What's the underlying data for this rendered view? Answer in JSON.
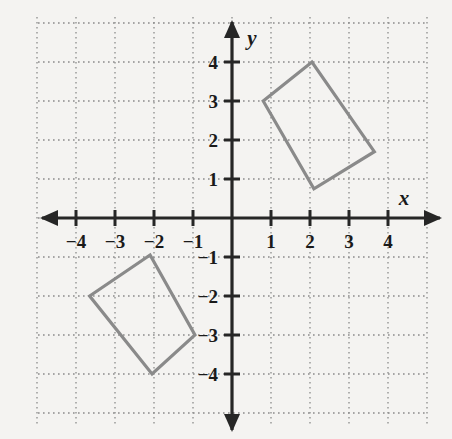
{
  "figure": {
    "type": "coordinate-plane-diagram",
    "title": "",
    "background_color": "#f4f3f1",
    "grid_color": "#8c8c8c",
    "axis_color": "#262626",
    "shape_color": "#8a8a8a"
  },
  "axes": {
    "x": {
      "label": "x",
      "ticks": [
        -4,
        -3,
        -2,
        -1,
        1,
        2,
        3,
        4
      ],
      "tick_labels": [
        "−4",
        "−3",
        "−2",
        "−1",
        "1",
        "2",
        "3",
        "4"
      ],
      "range": [
        -5,
        5
      ],
      "arrows": "both"
    },
    "y": {
      "label": "y",
      "ticks": [
        4,
        3,
        2,
        1,
        -1,
        -2,
        -3,
        -4
      ],
      "tick_labels": [
        "4",
        "3",
        "2",
        "1",
        "−1",
        "−2",
        "−3",
        "−4"
      ],
      "range": [
        -5.2,
        5.2
      ],
      "arrows": "both"
    },
    "grid": "on",
    "grid_style": "dotted",
    "origin_label": ""
  },
  "chart_data": {
    "type": "scatter",
    "title": "",
    "xlabel": "x",
    "ylabel": "y",
    "xlim": [
      -5,
      5
    ],
    "ylim": [
      -5.2,
      5.2
    ],
    "grid": true,
    "legend": "none",
    "series": [
      {
        "name": "upper-right-rectangle",
        "kind": "polygon",
        "closed": true,
        "points": [
          [
            0.8,
            3.0
          ],
          [
            2.05,
            4.0
          ],
          [
            3.65,
            1.7
          ],
          [
            2.1,
            0.75
          ]
        ]
      },
      {
        "name": "lower-left-rectangle",
        "kind": "polygon",
        "closed": true,
        "points": [
          [
            -3.65,
            -2.0
          ],
          [
            -2.1,
            -0.95
          ],
          [
            -0.95,
            -3.0
          ],
          [
            -2.05,
            -4.0
          ]
        ]
      }
    ]
  },
  "geometry_pixels": {
    "origin_x": 232,
    "origin_y": 218,
    "unit": 39,
    "grid_left": 38,
    "grid_top": 17,
    "grid_right": 428,
    "grid_bottom": 424
  }
}
